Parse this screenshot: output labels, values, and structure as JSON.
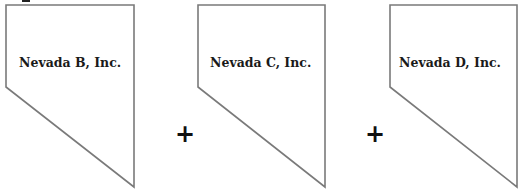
{
  "diagram": {
    "type": "entity-combination",
    "shape": "nevada-state-outline",
    "entities": [
      {
        "label": "Nevada B, Inc."
      },
      {
        "label": "Nevada C, Inc."
      },
      {
        "label": "Nevada D, Inc."
      }
    ],
    "operators": [
      "+",
      "+"
    ],
    "colors": {
      "outline": "#7a7a7a",
      "text": "#1a1a1a",
      "background": "#ffffff"
    }
  }
}
